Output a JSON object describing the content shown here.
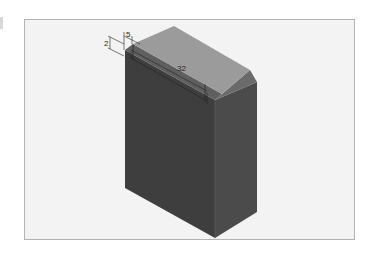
{
  "drawing": {
    "type": "isometric-cad-view",
    "part": "rectangular block with chamfered top edge",
    "colors": {
      "background": "#f3f3f3",
      "frame": "#b4b4b4",
      "top_face": "#9a9a9a",
      "chamfer_face": "#5e5e5e",
      "left_face": "#3e3e3e",
      "right_face": "#4a4a4a",
      "dimension_line": "#222222"
    },
    "dimensions": [
      {
        "id": "chamfer-width",
        "label": "5"
      },
      {
        "id": "chamfer-height",
        "label": "2"
      },
      {
        "id": "length",
        "label": "32"
      }
    ]
  }
}
